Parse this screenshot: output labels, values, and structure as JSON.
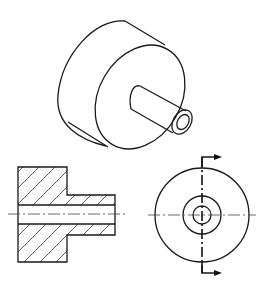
{
  "diagram": {
    "type": "engineering-drawing",
    "views": [
      {
        "name": "isometric-view",
        "description": "Large disk with a smaller hollow cylindrical boss protruding from its front face"
      },
      {
        "name": "section-view",
        "description": "Full section showing hatched solid, stepped profile and through bore with centerline"
      },
      {
        "name": "end-view",
        "description": "Three concentric circles with centerlines and cutting-plane line with direction arrows"
      }
    ],
    "colors": {
      "line": "#1a1a1a",
      "background": "#ffffff"
    }
  }
}
